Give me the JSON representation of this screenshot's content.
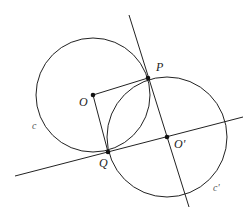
{
  "diagram": {
    "type": "geometry",
    "points": [
      {
        "id": "O",
        "label": "O",
        "x": 93,
        "y": 95
      },
      {
        "id": "P",
        "label": "P",
        "x": 148,
        "y": 78
      },
      {
        "id": "Q",
        "label": "Q",
        "x": 108,
        "y": 152
      },
      {
        "id": "O2",
        "label": "O'",
        "x": 167,
        "y": 137
      }
    ],
    "circles": [
      {
        "id": "c",
        "label": "c",
        "center": "O",
        "radius": 57
      },
      {
        "id": "c2",
        "label": "c'",
        "center": "O2",
        "radius": 60
      }
    ],
    "segments": [
      {
        "from": "O",
        "to": "P"
      },
      {
        "from": "O",
        "to": "Q"
      }
    ],
    "lines": [
      {
        "through": [
          "P",
          "O2"
        ],
        "label": "line PO'"
      },
      {
        "through": [
          "Q",
          "O2"
        ],
        "label": "line QO'"
      }
    ],
    "labels": {
      "O": "O",
      "P": "P",
      "Q": "Q",
      "O2": "O'",
      "c": "c",
      "c2": "c'"
    },
    "colors": {
      "stroke": "#222222",
      "background": "#ffffff"
    }
  }
}
